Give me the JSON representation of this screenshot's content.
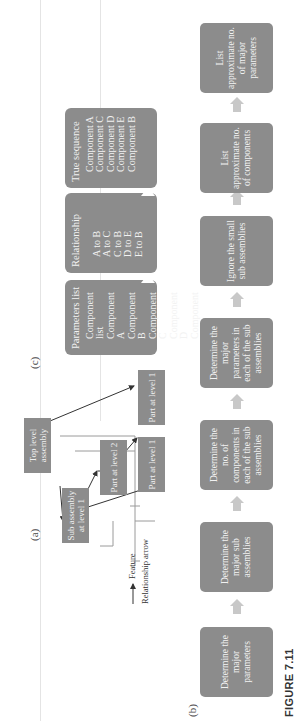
{
  "figure": {
    "label": "FIGURE 7.11",
    "colors": {
      "box_fill": "#8c8c8c",
      "box_text": "#f2f2f2",
      "arrow_fill": "#c8c8c8",
      "line": "#e4e4e4"
    },
    "orientation": "rotated 90 degrees counter-clockwise"
  },
  "panel_a": {
    "label": "(a)",
    "nodes": {
      "top": "Top level assembly",
      "sub": "Sub assembly at level 1",
      "part2": "Part at level 2",
      "part1a": "Part at level 1",
      "part1b": "Part at level 1"
    },
    "legend": {
      "feature": "Feature",
      "relationship": "Relationship arrow"
    }
  },
  "panel_b": {
    "label": "(b)",
    "steps": [
      "Determine the major parameters",
      "Determine the major sub assemblies",
      "Determine the no. of components in each of the sub assemblies",
      "Determine the major parameters in each of the sub assemblies",
      "Ignore the small sub assemblies",
      "List approximate no. of components",
      "List approximate no. of major parameters"
    ]
  },
  "panel_c": {
    "label": "(c)",
    "boxes": [
      {
        "title": "Parameters list",
        "items": [
          "Component list",
          "Component A",
          "Component B",
          "Component C",
          "Component D",
          "Component E"
        ]
      },
      {
        "title": "Relationship",
        "items": [
          "A to B",
          "A to C",
          "C to B",
          "D to E",
          "E to B"
        ]
      },
      {
        "title": "True sequence",
        "items": [
          "Component A",
          "Component C",
          "Component D",
          "Component E",
          "Component B"
        ]
      }
    ]
  }
}
